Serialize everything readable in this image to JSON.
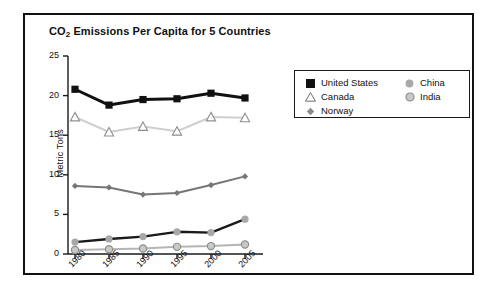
{
  "chart_data": {
    "type": "line",
    "title": "CO2 Emissions Per Capita for 5 Countries",
    "title_prefix": "CO",
    "title_subscript": "2",
    "title_suffix": " Emissions Per Capita for 5 Countries",
    "xlabel": "",
    "ylabel": "Metric Tons",
    "categories": [
      "1980",
      "1985",
      "1990",
      "1995",
      "2000",
      "2005"
    ],
    "x": [
      1980,
      1985,
      1990,
      1995,
      2000,
      2005
    ],
    "ylim": [
      0,
      25
    ],
    "yticks": [
      0,
      5,
      10,
      15,
      20,
      25
    ],
    "grid": false,
    "legend_position": "upper right outside",
    "series": [
      {
        "name": "United States",
        "marker": "filled-square",
        "color": "#111111",
        "marker_color": "#111111",
        "values": [
          20.8,
          18.8,
          19.5,
          19.6,
          20.3,
          19.7
        ]
      },
      {
        "name": "Canada",
        "marker": "open-triangle",
        "color": "#cfcfcf",
        "marker_color": "#9a9a9a",
        "values": [
          17.3,
          15.4,
          16.1,
          15.5,
          17.3,
          17.2
        ]
      },
      {
        "name": "Norway",
        "marker": "small-diamond",
        "color": "#767676",
        "marker_color": "#767676",
        "values": [
          8.6,
          8.4,
          7.5,
          7.7,
          8.7,
          9.8
        ]
      },
      {
        "name": "China",
        "marker": "filled-circle",
        "color": "#1a1a1a",
        "marker_color": "#a8a8a8",
        "values": [
          1.5,
          1.9,
          2.2,
          2.8,
          2.7,
          4.4
        ]
      },
      {
        "name": "India",
        "marker": "ring-circle",
        "color": "#b5b5b5",
        "marker_color": "#bdbdbd",
        "values": [
          0.5,
          0.6,
          0.7,
          0.9,
          1.0,
          1.2
        ]
      }
    ]
  },
  "legend": {
    "left_column": [
      {
        "label": "United States",
        "marker": "filled-square"
      },
      {
        "label": "Canada",
        "marker": "open-triangle"
      },
      {
        "label": "Norway",
        "marker": "small-diamond"
      }
    ],
    "right_column": [
      {
        "label": "China",
        "marker": "filled-circle"
      },
      {
        "label": "India",
        "marker": "ring-circle"
      }
    ]
  },
  "axis": {
    "y_tick_labels": [
      "25",
      "20",
      "15",
      "10",
      "5",
      "0"
    ],
    "x_tick_labels": [
      "1980",
      "1985",
      "1990",
      "1995",
      "2000",
      "2005"
    ],
    "y_axis_title": "Metric Tons"
  },
  "colors": {
    "frame": "#111111",
    "axis": "#1a1a1a",
    "background": "#ffffff",
    "us": "#111111",
    "canada": "#cfcfcf",
    "norway": "#767676",
    "china": "#1a1a1a",
    "india": "#b5b5b5"
  }
}
